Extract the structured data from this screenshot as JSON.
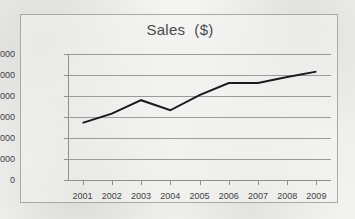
{
  "chart": {
    "title": "Sales  ($)",
    "frame_border_color": "#a9a9a7",
    "gridline_color": "#9b9b99",
    "series_color": "#1a1a1a",
    "background_color": "#f2f2f0"
  },
  "chart_data": {
    "type": "line",
    "title": "Sales  ($)",
    "xlabel": "",
    "ylabel": "",
    "categories": [
      "2001",
      "2002",
      "2003",
      "2004",
      "2005",
      "2006",
      "2007",
      "2008",
      "2009"
    ],
    "values": [
      136000,
      158000,
      190000,
      166000,
      202000,
      231000,
      231000,
      245000,
      258000
    ],
    "series": [
      {
        "name": "Sales ($)",
        "values": [
          136000,
          158000,
          190000,
          166000,
          202000,
          231000,
          231000,
          245000,
          258000
        ]
      }
    ],
    "ylim": [
      0,
      300000
    ],
    "yticks": [
      0,
      50000,
      100000,
      150000,
      200000,
      250000,
      300000
    ],
    "ytick_labels": [
      "0",
      "50000",
      "100000",
      "150000",
      "200000",
      "250000",
      "300000"
    ],
    "grid": true,
    "grid_axis": "y",
    "legend": false,
    "legend_position": "none",
    "marker": "none",
    "line_width": 2
  }
}
